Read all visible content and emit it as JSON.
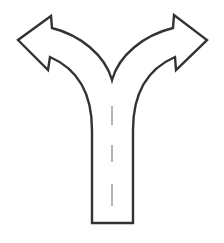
{
  "icon": {
    "name": "fork-in-road-icon",
    "title": "Two-way split road arrow",
    "stroke_color": "#333333",
    "dash_color": "#9a9a9a",
    "fill_color": "#ffffff",
    "directions": [
      "left",
      "right"
    ]
  }
}
